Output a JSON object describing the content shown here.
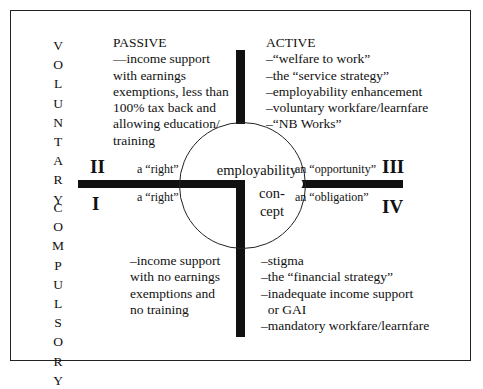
{
  "diagram": {
    "axis_vertical_top": "VOLUNTARY",
    "axis_vertical_bottom": "COMPULSORY",
    "quadrants": {
      "II": {
        "numeral": "II",
        "heading": "PASSIVE",
        "lines": [
          "—income support",
          "with earnings",
          "exemptions, less than",
          "100% tax back and",
          "allowing education/",
          "training"
        ],
        "edge_label": "a “right”"
      },
      "III": {
        "numeral": "III",
        "heading": "ACTIVE",
        "lines": [
          "–“welfare to work”",
          "–the “service strategy”",
          "–employability enhancement",
          "–voluntary workfare/learnfare",
          "–“NB Works”"
        ],
        "edge_label": "an “opportunity”"
      },
      "I": {
        "numeral": "I",
        "lines": [
          "–income support",
          "with no earnings",
          "exemptions and",
          "no training"
        ],
        "edge_label": "a “right”"
      },
      "IV": {
        "numeral": "IV",
        "lines": [
          "–stigma",
          "–the “financial strategy”",
          "–inadequate income support",
          "  or GAI",
          "–mandatory workfare/learnfare"
        ],
        "edge_label": "an “obligation”"
      }
    },
    "center": {
      "line1": "employability",
      "line2": "con-",
      "line3": "cept"
    }
  }
}
